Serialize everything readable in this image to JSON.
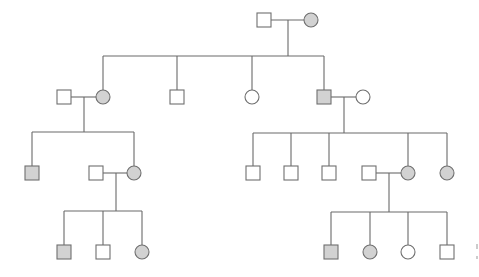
{
  "diagram": {
    "type": "pedigree",
    "colors": {
      "affected_fill": "#d2d2d2",
      "unaffected_fill": "#ffffff",
      "stroke": "#6f6f6f",
      "line": "#6a6a6a"
    },
    "size": 14,
    "individuals": [
      {
        "id": "I1",
        "sex": "male",
        "affected": false,
        "x": 264,
        "y": 20
      },
      {
        "id": "I2",
        "sex": "female",
        "affected": true,
        "x": 311,
        "y": 20
      },
      {
        "id": "II1",
        "sex": "male",
        "affected": false,
        "x": 64,
        "y": 97
      },
      {
        "id": "II2",
        "sex": "female",
        "affected": true,
        "x": 103,
        "y": 97
      },
      {
        "id": "II3",
        "sex": "male",
        "affected": false,
        "x": 177,
        "y": 97
      },
      {
        "id": "II4",
        "sex": "female",
        "affected": false,
        "x": 252,
        "y": 97
      },
      {
        "id": "II5",
        "sex": "male",
        "affected": true,
        "x": 324,
        "y": 97
      },
      {
        "id": "II6",
        "sex": "female",
        "affected": false,
        "x": 363,
        "y": 97
      },
      {
        "id": "III1",
        "sex": "male",
        "affected": true,
        "x": 32,
        "y": 173
      },
      {
        "id": "III2",
        "sex": "male",
        "affected": false,
        "x": 96,
        "y": 173
      },
      {
        "id": "III3",
        "sex": "female",
        "affected": true,
        "x": 134,
        "y": 173
      },
      {
        "id": "III4",
        "sex": "male",
        "affected": false,
        "x": 253,
        "y": 173
      },
      {
        "id": "III5",
        "sex": "male",
        "affected": false,
        "x": 291,
        "y": 173
      },
      {
        "id": "III6",
        "sex": "male",
        "affected": false,
        "x": 329,
        "y": 173
      },
      {
        "id": "III7",
        "sex": "male",
        "affected": false,
        "x": 369,
        "y": 173
      },
      {
        "id": "III8",
        "sex": "female",
        "affected": true,
        "x": 408,
        "y": 173
      },
      {
        "id": "III9",
        "sex": "female",
        "affected": true,
        "x": 447,
        "y": 173
      },
      {
        "id": "IV1",
        "sex": "male",
        "affected": true,
        "x": 64,
        "y": 252
      },
      {
        "id": "IV2",
        "sex": "male",
        "affected": false,
        "x": 103,
        "y": 252
      },
      {
        "id": "IV3",
        "sex": "female",
        "affected": true,
        "x": 142,
        "y": 252
      },
      {
        "id": "IV4",
        "sex": "male",
        "affected": true,
        "x": 331,
        "y": 252
      },
      {
        "id": "IV5",
        "sex": "female",
        "affected": true,
        "x": 370,
        "y": 252
      },
      {
        "id": "IV6",
        "sex": "female",
        "affected": false,
        "x": 408,
        "y": 252
      },
      {
        "id": "IV7",
        "sex": "male",
        "affected": false,
        "x": 447,
        "y": 252
      }
    ],
    "lines": [
      [
        271,
        20,
        304,
        20
      ],
      [
        288,
        20,
        288,
        56
      ],
      [
        103,
        56,
        324,
        56
      ],
      [
        103,
        56,
        103,
        90
      ],
      [
        177,
        56,
        177,
        90
      ],
      [
        252,
        56,
        252,
        90
      ],
      [
        324,
        56,
        324,
        90
      ],
      [
        71,
        97,
        96,
        97
      ],
      [
        84,
        97,
        84,
        132
      ],
      [
        32,
        132,
        134,
        132
      ],
      [
        32,
        132,
        32,
        166
      ],
      [
        134,
        132,
        134,
        166
      ],
      [
        331,
        97,
        356,
        97
      ],
      [
        344,
        97,
        344,
        133
      ],
      [
        253,
        133,
        447,
        133
      ],
      [
        253,
        133,
        253,
        166
      ],
      [
        291,
        133,
        291,
        166
      ],
      [
        329,
        133,
        329,
        166
      ],
      [
        408,
        133,
        408,
        166
      ],
      [
        447,
        133,
        447,
        166
      ],
      [
        103,
        173,
        127,
        173
      ],
      [
        116,
        173,
        116,
        211
      ],
      [
        64,
        211,
        142,
        211
      ],
      [
        64,
        211,
        64,
        245
      ],
      [
        103,
        211,
        103,
        245
      ],
      [
        142,
        211,
        142,
        245
      ],
      [
        376,
        173,
        401,
        173
      ],
      [
        389,
        173,
        389,
        212
      ],
      [
        331,
        212,
        447,
        212
      ],
      [
        331,
        212,
        331,
        245
      ],
      [
        370,
        212,
        370,
        245
      ],
      [
        408,
        212,
        408,
        245
      ],
      [
        447,
        212,
        447,
        245
      ]
    ],
    "edge_marks": [
      [
        477,
        244,
        477,
        249
      ],
      [
        477,
        256,
        477,
        259
      ]
    ]
  }
}
